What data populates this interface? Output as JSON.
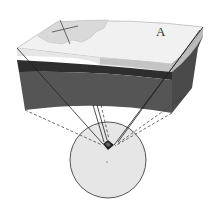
{
  "diagram": {
    "labels": {
      "a": "A"
    },
    "colors": {
      "surface_land": "#e2e2e2",
      "surface_ocean": "#f2f2f2",
      "light_layer": "#cfcfcf",
      "dark_band": "#2e2e2e",
      "mantle": "#555555",
      "side_face": "#4a4a4a",
      "globe_fill": "#e6e6e6",
      "globe_stroke": "#555555",
      "lines": "#222222"
    },
    "elements": [
      "crust block with curved layers",
      "label A on surface",
      "solid projection lines to globe",
      "dashed projection lines to globe",
      "globe with highlighted wedge",
      "center point"
    ]
  }
}
